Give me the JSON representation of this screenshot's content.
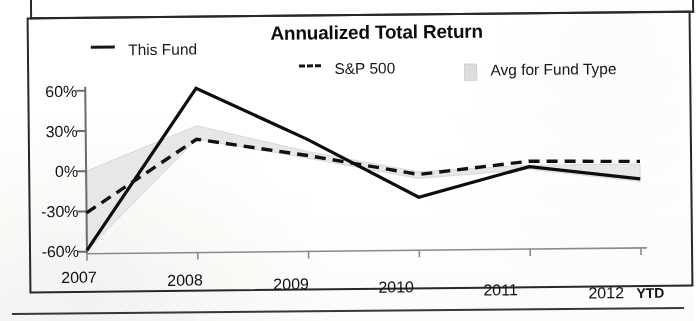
{
  "figure": {
    "title": "Annualized Total Return",
    "frames": {
      "top_box": "partial-frame",
      "chart_box": "chart-frame"
    }
  },
  "legend": {
    "position": "top",
    "items": [
      {
        "label": "This Fund",
        "marker": "solid-line",
        "color": "#1a1a1a"
      },
      {
        "label": "S&P 500",
        "marker": "dashed-line",
        "color": "#1a1a1a"
      },
      {
        "label": "Avg for Fund Type",
        "marker": "shaded-band",
        "color": "#d9d9d9"
      }
    ]
  },
  "axes": {
    "y_ticks": [
      "60%",
      "30%",
      "0%",
      "-30%",
      "-60%"
    ],
    "x_ticks": [
      "2007",
      "2008",
      "2009",
      "2010",
      "2011",
      "2012"
    ],
    "x_suffix": "YTD"
  },
  "chart_data": {
    "type": "line",
    "title": "Annualized Total Return",
    "xlabel": "",
    "ylabel": "",
    "x": [
      "2007",
      "2008",
      "2009",
      "2010",
      "2011",
      "2012 YTD"
    ],
    "ylim": [
      -60,
      60
    ],
    "ytick_values": [
      60,
      30,
      0,
      -30,
      -60
    ],
    "ytick_labels": [
      "60%",
      "30%",
      "0%",
      "-30%",
      "-60%"
    ],
    "grid": false,
    "legend_position": "top",
    "series": [
      {
        "name": "This Fund",
        "style": "solid",
        "color": "#1a1a1a",
        "values": [
          -59,
          61,
          22,
          -22,
          0,
          -10
        ]
      },
      {
        "name": "S&P 500",
        "style": "dashed",
        "color": "#1a1a1a",
        "values": [
          -31,
          23,
          10,
          -5,
          4,
          3
        ]
      },
      {
        "name": "Avg for Fund Type",
        "style": "band",
        "color": "#d9d9d9",
        "band_upper": [
          0,
          33,
          13,
          -3,
          1,
          1
        ],
        "band_lower": [
          -59,
          23,
          8,
          -8,
          -2,
          -12
        ]
      }
    ]
  }
}
